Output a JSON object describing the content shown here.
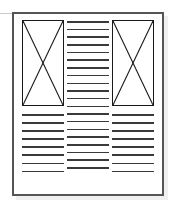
{
  "diagram": {
    "type": "page-layout-wireframe",
    "canvas": {
      "width": 178,
      "height": 215,
      "background": "#ffffff"
    },
    "sheet": {
      "border_color": "#555555",
      "fill": "#ffffff",
      "x": 12,
      "y": 12,
      "width": 152,
      "height": 184,
      "shadow_color": "#f0f0f0"
    },
    "guides": [
      {
        "name": "left-bleed-rule",
        "color": "#c9c9c9",
        "y": 13
      }
    ],
    "ink": {
      "rule_color": "#3a3a3a",
      "placeholder_stroke": "#1a1a1a"
    },
    "columns": [
      {
        "id": "left",
        "label": "Left column",
        "image_placeholder": {
          "label": "Image placeholder",
          "glyph": "crossed-box",
          "width": 42,
          "height": 86
        },
        "text_lines": 8
      },
      {
        "id": "center",
        "label": "Center column",
        "image_placeholder": null,
        "text_lines": 20
      },
      {
        "id": "right",
        "label": "Right column",
        "image_placeholder": {
          "label": "Image placeholder",
          "glyph": "crossed-box",
          "width": 42,
          "height": 86
        },
        "text_lines": 8
      }
    ]
  }
}
